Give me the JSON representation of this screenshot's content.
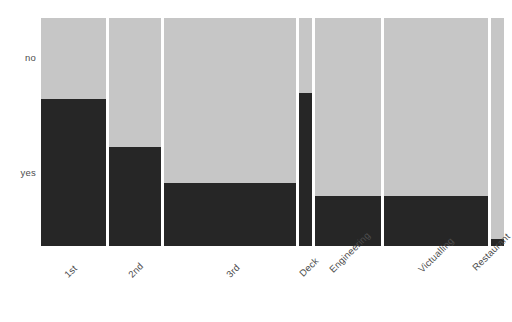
{
  "chart_data": {
    "type": "bar",
    "subtype": "mosaic",
    "title": "",
    "xlabel": "",
    "ylabel": "",
    "grid": false,
    "legend": false,
    "y_categories": [
      "no",
      "yes"
    ],
    "y_tick_labels": [
      "no",
      "yes"
    ],
    "categories": [
      "1st",
      "2nd",
      "3rd",
      "Deck",
      "Engineering",
      "Victualling",
      "Restaurant"
    ],
    "x_tick_labels": [
      "1st",
      "2nd",
      "3rd",
      "Deck",
      "Engineering",
      "Victualling",
      "Restaurant"
    ],
    "column_widths_fraction": [
      0.143,
      0.115,
      0.29,
      0.028,
      0.145,
      0.228,
      0.028
    ],
    "series": [
      {
        "name": "no",
        "values": [
          0.355,
          0.566,
          0.724,
          0.329,
          0.781,
          0.781,
          0.969
        ]
      },
      {
        "name": "yes",
        "values": [
          0.645,
          0.434,
          0.276,
          0.671,
          0.219,
          0.219,
          0.031
        ]
      }
    ],
    "colors": {
      "no": "#c6c6c6",
      "yes": "#262626",
      "gap": "#ffffff",
      "background": "#ffffff",
      "text": "#4d4d4d"
    },
    "cells": [
      {
        "category": "1st",
        "no": 0.355,
        "yes": 0.645
      },
      {
        "category": "2nd",
        "no": 0.566,
        "yes": 0.434
      },
      {
        "category": "3rd",
        "no": 0.724,
        "yes": 0.276
      },
      {
        "category": "Deck",
        "no": 0.329,
        "yes": 0.671
      },
      {
        "category": "Engineering",
        "no": 0.781,
        "yes": 0.219
      },
      {
        "category": "Victualling",
        "no": 0.781,
        "yes": 0.219
      },
      {
        "category": "Restaurant",
        "no": 0.969,
        "yes": 0.031
      }
    ]
  }
}
